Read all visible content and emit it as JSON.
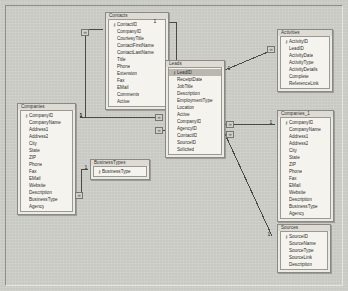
{
  "window": {
    "title": "Relationships",
    "canvas_background": "#c9c9c4",
    "table_header_color": "#dedbd4",
    "table_body_color": "#f4f3ee",
    "border_color": "#8a8a84",
    "selection_color": "#b9b7b0"
  },
  "key_glyph": "ᵟ8",
  "symbols": {
    "primary_key": "⚷",
    "many": "∞",
    "one": "1"
  },
  "tables": [
    {
      "name": "Contacts",
      "x": 105,
      "y": 12,
      "width": 62,
      "fields": [
        {
          "name": "ContactID",
          "pk": true,
          "selected": false
        },
        {
          "name": "CompanyID",
          "pk": false,
          "selected": false
        },
        {
          "name": "CourtesyTitle",
          "pk": false,
          "selected": false
        },
        {
          "name": "ContactFirstName",
          "pk": false,
          "selected": false
        },
        {
          "name": "ContactLastName",
          "pk": false,
          "selected": false
        },
        {
          "name": "Title",
          "pk": false,
          "selected": false
        },
        {
          "name": "Phone",
          "pk": false,
          "selected": false
        },
        {
          "name": "Extension",
          "pk": false,
          "selected": false
        },
        {
          "name": "Fax",
          "pk": false,
          "selected": false
        },
        {
          "name": "EMail",
          "pk": false,
          "selected": false
        },
        {
          "name": "Comments",
          "pk": false,
          "selected": false
        },
        {
          "name": "Active",
          "pk": false,
          "selected": false
        }
      ]
    },
    {
      "name": "Leads",
      "x": 165,
      "y": 60,
      "width": 58,
      "fields": [
        {
          "name": "LeadID",
          "pk": true,
          "selected": true
        },
        {
          "name": "ReceiptDate",
          "pk": false,
          "selected": false
        },
        {
          "name": "JobTitle",
          "pk": false,
          "selected": false
        },
        {
          "name": "Description",
          "pk": false,
          "selected": false
        },
        {
          "name": "EmploymentType",
          "pk": false,
          "selected": false
        },
        {
          "name": "Location",
          "pk": false,
          "selected": false
        },
        {
          "name": "Active",
          "pk": false,
          "selected": false
        },
        {
          "name": "CompanyID",
          "pk": false,
          "selected": false
        },
        {
          "name": "AgencyID",
          "pk": false,
          "selected": false
        },
        {
          "name": "ContactID",
          "pk": false,
          "selected": false
        },
        {
          "name": "SourceID",
          "pk": false,
          "selected": false
        },
        {
          "name": "Solicited",
          "pk": false,
          "selected": false
        }
      ]
    },
    {
      "name": "Activities",
      "x": 277,
      "y": 29,
      "width": 54,
      "fields": [
        {
          "name": "ActivityID",
          "pk": true,
          "selected": false
        },
        {
          "name": "LeadID",
          "pk": false,
          "selected": false
        },
        {
          "name": "ActivityDate",
          "pk": false,
          "selected": false
        },
        {
          "name": "ActivityType",
          "pk": false,
          "selected": false
        },
        {
          "name": "ActivityDetails",
          "pk": false,
          "selected": false
        },
        {
          "name": "Complete",
          "pk": false,
          "selected": false
        },
        {
          "name": "ReferenceLink",
          "pk": false,
          "selected": false
        }
      ]
    },
    {
      "name": "Companies",
      "x": 17,
      "y": 103,
      "width": 57,
      "fields": [
        {
          "name": "CompanyID",
          "pk": true,
          "selected": false
        },
        {
          "name": "CompanyName",
          "pk": false,
          "selected": false
        },
        {
          "name": "Address1",
          "pk": false,
          "selected": false
        },
        {
          "name": "Address2",
          "pk": false,
          "selected": false
        },
        {
          "name": "City",
          "pk": false,
          "selected": false
        },
        {
          "name": "State",
          "pk": false,
          "selected": false
        },
        {
          "name": "ZIP",
          "pk": false,
          "selected": false
        },
        {
          "name": "Phone",
          "pk": false,
          "selected": false
        },
        {
          "name": "Fax",
          "pk": false,
          "selected": false
        },
        {
          "name": "EMail",
          "pk": false,
          "selected": false
        },
        {
          "name": "Website",
          "pk": false,
          "selected": false
        },
        {
          "name": "Description",
          "pk": false,
          "selected": false
        },
        {
          "name": "BusinessType",
          "pk": false,
          "selected": false
        },
        {
          "name": "Agency",
          "pk": false,
          "selected": false
        }
      ]
    },
    {
      "name": "Companies_1",
      "x": 277,
      "y": 110,
      "width": 55,
      "fields": [
        {
          "name": "CompanyID",
          "pk": true,
          "selected": false
        },
        {
          "name": "CompanyName",
          "pk": false,
          "selected": false
        },
        {
          "name": "Address1",
          "pk": false,
          "selected": false
        },
        {
          "name": "Address2",
          "pk": false,
          "selected": false
        },
        {
          "name": "City",
          "pk": false,
          "selected": false
        },
        {
          "name": "State",
          "pk": false,
          "selected": false
        },
        {
          "name": "ZIP",
          "pk": false,
          "selected": false
        },
        {
          "name": "Phone",
          "pk": false,
          "selected": false
        },
        {
          "name": "Fax",
          "pk": false,
          "selected": false
        },
        {
          "name": "EMail",
          "pk": false,
          "selected": false
        },
        {
          "name": "Website",
          "pk": false,
          "selected": false
        },
        {
          "name": "Description",
          "pk": false,
          "selected": false
        },
        {
          "name": "BusinessType",
          "pk": false,
          "selected": false
        },
        {
          "name": "Agency",
          "pk": false,
          "selected": false
        }
      ]
    },
    {
      "name": "BusinessTypes",
      "x": 90,
      "y": 159,
      "width": 58,
      "fields": [
        {
          "name": "BusinessType",
          "pk": true,
          "selected": false
        }
      ]
    },
    {
      "name": "Sources",
      "x": 277,
      "y": 224,
      "width": 52,
      "fields": [
        {
          "name": "SourceID",
          "pk": true,
          "selected": false
        },
        {
          "name": "SourceName",
          "pk": false,
          "selected": false
        },
        {
          "name": "SourceType",
          "pk": false,
          "selected": false
        },
        {
          "name": "SourceLink",
          "pk": false,
          "selected": false
        },
        {
          "name": "Description",
          "pk": false,
          "selected": false
        }
      ]
    }
  ],
  "relationships": [
    {
      "id": "companies-contacts",
      "from_table": "Companies",
      "from_field": "CompanyID",
      "to_table": "Contacts",
      "to_field": "CompanyID",
      "from_cardinality": "1",
      "to_cardinality": "∞",
      "path": "M 80,117 L 85,117 L 85,29 L 103,29",
      "one_label": {
        "x": 78,
        "y": 113,
        "text": "1"
      },
      "many_label": {
        "x": 81,
        "y": 29,
        "text": "∞"
      }
    },
    {
      "id": "contacts-leads",
      "from_table": "Contacts",
      "from_field": "ContactID",
      "to_table": "Leads",
      "to_field": "ContactID",
      "from_cardinality": "1",
      "to_cardinality": "∞",
      "path": "M 169,22 L 176,22 L 176,130 L 163,130",
      "one_label": {
        "x": 152,
        "y": 19,
        "text": "1"
      },
      "many_label": {
        "x": 155,
        "y": 127,
        "text": "∞"
      }
    },
    {
      "id": "leads-activities",
      "from_table": "Leads",
      "from_field": "LeadID",
      "to_table": "Activities",
      "to_field": "LeadID",
      "from_cardinality": "1",
      "to_cardinality": "∞",
      "path": "M 225,70 L 275,49",
      "one_label": {
        "x": 226,
        "y": 66,
        "text": "1"
      },
      "many_label": {
        "x": 267,
        "y": 46,
        "text": "∞"
      }
    },
    {
      "id": "leads-companies",
      "from_table": "Leads",
      "from_field": "CompanyID",
      "to_table": "Companies",
      "to_field": "CompanyID",
      "from_cardinality": "∞",
      "to_cardinality": "1",
      "path": "M 163,117 L 80,117",
      "one_label": {
        "x": 78,
        "y": 113,
        "text": "1"
      },
      "many_label": {
        "x": 155,
        "y": 114,
        "text": "∞"
      }
    },
    {
      "id": "leads-companies1",
      "from_table": "Leads",
      "from_field": "AgencyID",
      "to_table": "Companies_1",
      "to_field": "CompanyID",
      "from_cardinality": "∞",
      "to_cardinality": "1",
      "path": "M 225,124 L 275,124",
      "one_label": {
        "x": 268,
        "y": 120,
        "text": "1"
      },
      "many_label": {
        "x": 226,
        "y": 121,
        "text": "∞"
      }
    },
    {
      "id": "leads-sources",
      "from_table": "Leads",
      "from_field": "SourceID",
      "to_table": "Sources",
      "to_field": "SourceID",
      "from_cardinality": "∞",
      "to_cardinality": "1",
      "path": "M 225,134 L 272,236",
      "one_label": {
        "x": 266,
        "y": 232,
        "text": "1"
      },
      "many_label": {
        "x": 226,
        "y": 131,
        "text": "∞"
      }
    },
    {
      "id": "companies-businesstypes",
      "from_table": "BusinessTypes",
      "from_field": "BusinessType",
      "to_table": "Companies",
      "to_field": "BusinessType",
      "from_cardinality": "1",
      "to_cardinality": "∞",
      "path": "M 88,169 L 81,169 L 81,195 L 76,195",
      "one_label": {
        "x": 83,
        "y": 165,
        "text": "1"
      },
      "many_label": {
        "x": 75,
        "y": 192,
        "text": "∞"
      }
    }
  ]
}
